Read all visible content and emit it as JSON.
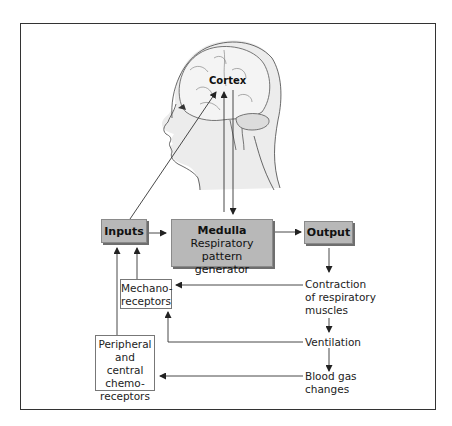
{
  "diagram": {
    "labels": {
      "cortex": "Cortex",
      "inputs": "Inputs",
      "medulla_title": "Medulla",
      "medulla_sub1": "Respiratory pattern",
      "medulla_sub2": "generator",
      "output": "Output",
      "mechano_1": "Mechano-",
      "mechano_2": "receptors",
      "chemo_1": "Peripheral",
      "chemo_2": "and central",
      "chemo_3": "chemo-",
      "chemo_4": "receptors",
      "contraction_1": "Contraction",
      "contraction_2": "of respiratory",
      "contraction_3": "muscles",
      "ventilation": "Ventilation",
      "bloodgas_1": "Blood gas",
      "bloodgas_2": "changes"
    },
    "flows": [
      {
        "from": "Inputs",
        "to": "Cortex"
      },
      {
        "from": "Cortex",
        "to": "Medulla"
      },
      {
        "from": "Medulla",
        "to": "Cortex"
      },
      {
        "from": "Inputs",
        "to": "Medulla"
      },
      {
        "from": "Medulla",
        "to": "Output"
      },
      {
        "from": "Output",
        "to": "Contraction of respiratory muscles"
      },
      {
        "from": "Contraction of respiratory muscles",
        "to": "Mechanoreceptors"
      },
      {
        "from": "Contraction of respiratory muscles",
        "to": "Ventilation"
      },
      {
        "from": "Ventilation",
        "to": "Mechanoreceptors"
      },
      {
        "from": "Ventilation",
        "to": "Blood gas changes"
      },
      {
        "from": "Blood gas changes",
        "to": "Peripheral and central chemoreceptors"
      },
      {
        "from": "Mechanoreceptors",
        "to": "Inputs"
      },
      {
        "from": "Peripheral and central chemoreceptors",
        "to": "Inputs"
      }
    ],
    "colors": {
      "box_fill": "#b8b8b8",
      "head_fill": "#ececec",
      "line": "#333333"
    }
  }
}
